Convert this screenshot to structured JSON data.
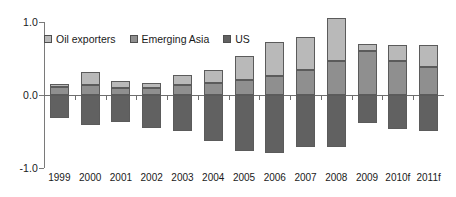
{
  "chart_data": {
    "type": "bar",
    "stacked": true,
    "title": "",
    "subtitle": "",
    "xlabel": "",
    "ylabel": "",
    "categories": [
      "1999",
      "2000",
      "2001",
      "2002",
      "2003",
      "2004",
      "2005",
      "2006",
      "2007",
      "2008",
      "2009",
      "2010f",
      "2011f"
    ],
    "series": [
      {
        "name": "Oil exporters",
        "color": "#b9b9b9",
        "values": [
          0.04,
          0.17,
          0.1,
          0.08,
          0.13,
          0.18,
          0.33,
          0.47,
          0.46,
          0.58,
          0.1,
          0.22,
          0.3
        ]
      },
      {
        "name": "Emerging Asia",
        "color": "#8f8f8f",
        "values": [
          0.11,
          0.14,
          0.09,
          0.09,
          0.14,
          0.16,
          0.2,
          0.26,
          0.34,
          0.47,
          0.6,
          0.47,
          0.39
        ]
      },
      {
        "name": "US",
        "color": "#616161",
        "values": [
          -0.32,
          -0.41,
          -0.37,
          -0.45,
          -0.49,
          -0.63,
          -0.77,
          -0.79,
          -0.71,
          -0.71,
          -0.38,
          -0.46,
          -0.49
        ]
      }
    ],
    "ylim": [
      -1.0,
      1.0
    ],
    "yticks": [
      1.0,
      0.0,
      -1.0
    ],
    "ytick_labels": [
      "1.0",
      "0.0",
      "-1.0"
    ],
    "grid": false,
    "legend_position": "top-left",
    "legend_entries": [
      "Oil exporters",
      "Emerging Asia",
      "US"
    ]
  }
}
